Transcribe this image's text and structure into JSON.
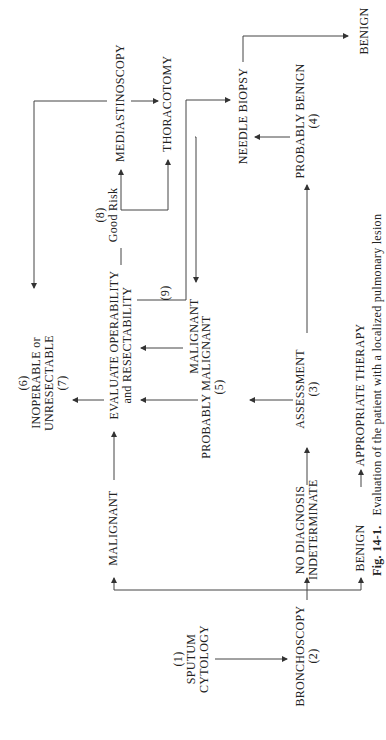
{
  "orientation": "rotated -90 degrees (text reads bottom to top)",
  "nodes": {
    "sputum": {
      "num": "(1)",
      "l1": "SPUTUM",
      "l2": "CYTOLOGY"
    },
    "bronchoscopy": {
      "l1": "BRONCHOSCOPY",
      "num": "(2)"
    },
    "malignant1": {
      "l1": "MALIGNANT"
    },
    "nodiag": {
      "l1": "NO DIAGNOSIS",
      "l2": "INDETERMINATE"
    },
    "benign1": {
      "l1": "BENIGN"
    },
    "therapy": {
      "l1": "APPROPRIATE THERAPY"
    },
    "evaluate": {
      "l1": "EVALUATE OPERABILITY",
      "l2": "and RESECTABILITY"
    },
    "assessment": {
      "l1": "ASSESSMENT",
      "num": "(3)"
    },
    "prob_malignant": {
      "l1": "PROBABLY MALIGNANT",
      "num": "(5)"
    },
    "inoperable": {
      "num1": "(6)",
      "l1": "INOPERABLE or",
      "l2": "UNRESECTABLE",
      "num2": "(7)"
    },
    "malignant2": {
      "l1": "MALIGNANT"
    },
    "num9": {
      "l1": "(9)"
    },
    "goodrisk": {
      "num": "(8)",
      "l1": "Good Risk"
    },
    "mediastinoscopy": {
      "l1": "MEDIASTINOSCOPY"
    },
    "thoracotomy": {
      "l1": "THORACOTOMY"
    },
    "needle": {
      "l1": "NEEDLE BIOPSY"
    },
    "prob_benign": {
      "l1": "PROBABLY BENIGN",
      "num": "(4)"
    },
    "benign2": {
      "l1": "BENIGN"
    }
  },
  "caption": {
    "label": "Fig. 14-1.",
    "text": "Evaluation of the patient with a localized pulmonary lesion"
  }
}
